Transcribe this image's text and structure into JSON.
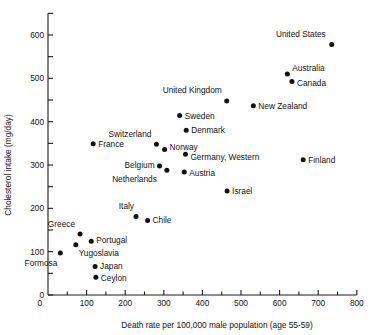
{
  "chart_data": {
    "type": "scatter",
    "title": "",
    "xlabel": "Death rate per 100,000 male population (age 55-59)",
    "ylabel": "Cholesterol intake (mg/day)",
    "xlim": [
      0,
      800
    ],
    "ylim": [
      0,
      650
    ],
    "x_ticks_major": [
      0,
      100,
      200,
      300,
      400,
      500,
      600,
      700,
      800
    ],
    "x_ticks_minor": [
      50,
      150,
      250,
      350,
      450,
      550,
      650,
      750
    ],
    "y_ticks_major": [
      0,
      100,
      200,
      300,
      400,
      500,
      600
    ],
    "y_ticks_minor": [
      50,
      150,
      250,
      350,
      450,
      550,
      650
    ],
    "grid": false,
    "legend": null,
    "marker": "filled-circle",
    "marker_color": "#111111",
    "points": [
      {
        "label": "United States",
        "x": 735,
        "y": 578,
        "label_dx": -6,
        "label_dy": -8,
        "anchor": "end"
      },
      {
        "label": "Australia",
        "x": 620,
        "y": 510,
        "label_dx": 5,
        "label_dy": -3,
        "anchor": "start"
      },
      {
        "label": "Canada",
        "x": 632,
        "y": 493,
        "label_dx": 5,
        "label_dy": 5,
        "anchor": "start"
      },
      {
        "label": "United Kingdom",
        "x": 463,
        "y": 448,
        "label_dx": -5,
        "label_dy": -8,
        "anchor": "end"
      },
      {
        "label": "New Zealand",
        "x": 532,
        "y": 437,
        "label_dx": 5,
        "label_dy": 3,
        "anchor": "start"
      },
      {
        "label": "Sweden",
        "x": 341,
        "y": 414,
        "label_dx": 5,
        "label_dy": 3,
        "anchor": "start"
      },
      {
        "label": "Denmark",
        "x": 358,
        "y": 380,
        "label_dx": 5,
        "label_dy": 3,
        "anchor": "start"
      },
      {
        "label": "France",
        "x": 117,
        "y": 349,
        "label_dx": 5,
        "label_dy": 3,
        "anchor": "start"
      },
      {
        "label": "Switzerland",
        "x": 281,
        "y": 348,
        "label_dx": -5,
        "label_dy": -7,
        "anchor": "end"
      },
      {
        "label": "Norway",
        "x": 302,
        "y": 336,
        "label_dx": 5,
        "label_dy": 1,
        "anchor": "start"
      },
      {
        "label": "Germany, Western",
        "x": 356,
        "y": 325,
        "label_dx": 5,
        "label_dy": 6,
        "anchor": "start"
      },
      {
        "label": "Finland",
        "x": 661,
        "y": 312,
        "label_dx": 5,
        "label_dy": 3,
        "anchor": "start"
      },
      {
        "label": "Belgium",
        "x": 289,
        "y": 298,
        "label_dx": -5,
        "label_dy": 2,
        "anchor": "end"
      },
      {
        "label": "Netherlands",
        "x": 308,
        "y": 288,
        "label_dx": -10,
        "label_dy": 12,
        "anchor": "end"
      },
      {
        "label": "Austria",
        "x": 353,
        "y": 284,
        "label_dx": 5,
        "label_dy": 4,
        "anchor": "start"
      },
      {
        "label": "Israel",
        "x": 464,
        "y": 240,
        "label_dx": 5,
        "label_dy": 3,
        "anchor": "start"
      },
      {
        "label": "Italy",
        "x": 228,
        "y": 181,
        "label_dx": -2,
        "label_dy": -8,
        "anchor": "end"
      },
      {
        "label": "Chile",
        "x": 258,
        "y": 172,
        "label_dx": 5,
        "label_dy": 3,
        "anchor": "start"
      },
      {
        "label": "Greece",
        "x": 83,
        "y": 141,
        "label_dx": -5,
        "label_dy": -7,
        "anchor": "end"
      },
      {
        "label": "Portugal",
        "x": 112,
        "y": 124,
        "label_dx": 5,
        "label_dy": 2,
        "anchor": "start"
      },
      {
        "label": "Yugoslavia",
        "x": 72,
        "y": 116,
        "label_dx": 3,
        "label_dy": 11,
        "anchor": "start"
      },
      {
        "label": "Formosa",
        "x": 32,
        "y": 97,
        "label_dx": -3,
        "label_dy": 13,
        "anchor": "end"
      },
      {
        "label": "Japan",
        "x": 122,
        "y": 66,
        "label_dx": 5,
        "label_dy": 3,
        "anchor": "start"
      },
      {
        "label": "Ceylon",
        "x": 124,
        "y": 41,
        "label_dx": 5,
        "label_dy": 4,
        "anchor": "start"
      }
    ]
  }
}
